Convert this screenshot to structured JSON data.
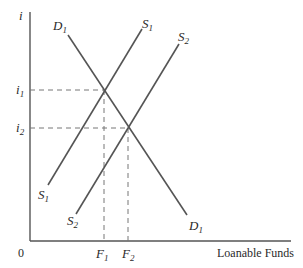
{
  "diagram": {
    "y_axis_label": "i",
    "x_axis_label": "Loanable Funds",
    "origin_label": "0",
    "curves": [
      {
        "id": "D1",
        "name": "D",
        "sub": "1",
        "type": "demand",
        "from": [
          68,
          35
        ],
        "to": [
          187,
          215
        ]
      },
      {
        "id": "S1",
        "name": "S",
        "sub": "1",
        "type": "supply",
        "from": [
          48,
          185
        ],
        "to": [
          142,
          29
        ]
      },
      {
        "id": "S2",
        "name": "S",
        "sub": "2",
        "type": "supply",
        "from": [
          76,
          214
        ],
        "to": [
          179,
          44
        ]
      }
    ],
    "equilibria": [
      {
        "id": "E1",
        "curves": [
          "D1",
          "S1"
        ],
        "rate_label": {
          "name": "i",
          "sub": "1"
        },
        "quantity_label": {
          "name": "F",
          "sub": "1"
        }
      },
      {
        "id": "E2",
        "curves": [
          "D1",
          "S2"
        ],
        "rate_label": {
          "name": "i",
          "sub": "2"
        },
        "quantity_label": {
          "name": "F",
          "sub": "2"
        }
      }
    ],
    "colors": {
      "line": "#555555",
      "text": "#2a2a2a",
      "guide": "#777777"
    }
  }
}
